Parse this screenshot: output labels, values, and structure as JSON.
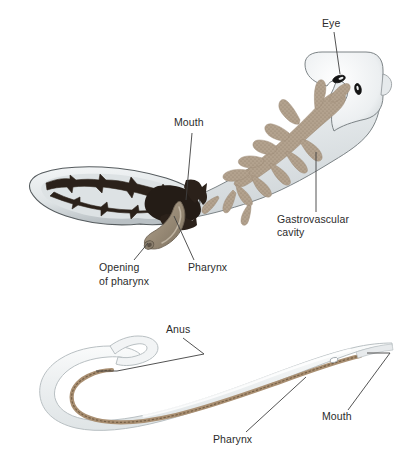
{
  "figure": {
    "title_visible": false,
    "background_color": "#ffffff",
    "panels": [
      {
        "id": "flatworm-panel",
        "organism": "planarian flatworm",
        "gut_type": "gastrovascular cavity (incomplete digestive tract)",
        "labels": [
          {
            "key": "eye",
            "text": "Eye",
            "x": 322,
            "y": 22,
            "leader": "from label down-left to dark eyespot on head"
          },
          {
            "key": "mouth",
            "text": "Mouth",
            "x": 174,
            "y": 121,
            "leader": "vertical line down to dark mouth region"
          },
          {
            "key": "gastrovascular_cavity_line1",
            "text": "Gastrovascular",
            "x": 277,
            "y": 218,
            "leader": "vertical line up into tan branched cavity"
          },
          {
            "key": "gastrovascular_cavity_line2",
            "text": "cavity",
            "x": 277,
            "y": 231,
            "leader": "none"
          },
          {
            "key": "pharynx",
            "text": "Pharynx",
            "x": 188,
            "y": 266,
            "leader": "diagonal line up-left to pharynx tube"
          },
          {
            "key": "opening_of_pharynx_line1",
            "text": "Opening",
            "x": 99,
            "y": 266,
            "leader": "diagonal line up-right to tip of pharynx tube"
          },
          {
            "key": "opening_of_pharynx_line2",
            "text": "of pharynx",
            "x": 99,
            "y": 280,
            "leader": "none"
          }
        ],
        "colors": {
          "body_fill": "#eef1f2",
          "body_edge": "#6d7477",
          "gastrovascular_branches": "#b3a28e",
          "dark_branches": "#2b211a",
          "pharynx_tube": "#9b8d7c",
          "eyespot": "#1a1a1a"
        }
      },
      {
        "id": "nematode-panel",
        "organism": "nematode roundworm",
        "gut_type": "complete digestive tract with mouth and anus",
        "labels": [
          {
            "key": "anus",
            "text": "Anus",
            "x": 166,
            "y": 328,
            "leader": "diagonal then horizontal line to gut at curved tail"
          },
          {
            "key": "pharynx",
            "text": "Pharynx",
            "x": 213,
            "y": 438,
            "leader": "diagonal line up-right to anterior gut tube"
          },
          {
            "key": "mouth",
            "text": "Mouth",
            "x": 322,
            "y": 415,
            "leader": "diagonal then horizontal line to anterior tip"
          }
        ],
        "colors": {
          "body_fill": "#f2f4f5",
          "body_edge": "#b9c0c3",
          "gut_tube": "#a98f72",
          "gut_speckle": "#6d5840"
        }
      }
    ],
    "leader_line_color": "#4a4a4a"
  }
}
